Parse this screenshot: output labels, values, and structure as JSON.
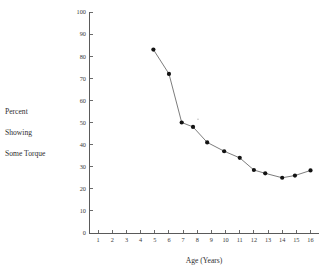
{
  "figure": {
    "background_color": "#ffffff",
    "axis_color": "#5a5a5a",
    "line_color": "#6d6d6d",
    "marker_color": "#131313"
  },
  "ylabel": {
    "line1": "Percent",
    "line2": "Showing",
    "line3": "Some Torque"
  },
  "xlabel": "Age (Years)",
  "chart_data": {
    "type": "line",
    "title": "",
    "subtitle": "",
    "xlabel": "Age (Years)",
    "ylabel": "Percent Showing Some Torque",
    "xlim": [
      0.35,
      16.6
    ],
    "ylim": [
      0,
      100
    ],
    "grid": false,
    "legend": "none",
    "xticks": [
      1,
      2,
      3,
      4,
      5,
      6,
      7,
      8,
      9,
      10,
      11,
      12,
      13,
      14,
      15,
      16
    ],
    "xtick_labels": [
      "1",
      "2",
      "3",
      "4",
      "5",
      "6",
      "7",
      "8",
      "9",
      "10",
      "11",
      "12",
      "13",
      "14",
      "15",
      "16"
    ],
    "yticks": [
      0,
      10,
      20,
      30,
      40,
      50,
      60,
      70,
      80,
      90,
      100
    ],
    "ytick_labels": [
      "0",
      "10",
      "20",
      "30",
      "40",
      "50",
      "60",
      "70",
      "80",
      "90",
      "100"
    ],
    "x": [
      4.9,
      6.0,
      6.9,
      7.7,
      8.7,
      9.9,
      11.0,
      12.0,
      12.8,
      14.0,
      14.9,
      16.0
    ],
    "y": [
      83,
      72,
      50,
      48,
      41,
      37,
      34,
      28.5,
      27,
      25,
      26,
      28.3
    ],
    "series": [
      {
        "name": "Percent Showing Some Torque",
        "x": [
          4.9,
          6.0,
          6.9,
          7.7,
          8.7,
          9.9,
          11.0,
          12.0,
          12.8,
          14.0,
          14.9,
          16.0
        ],
        "values": [
          83,
          72,
          50,
          48,
          41,
          37,
          34,
          28.5,
          27,
          25,
          26,
          28.3
        ]
      }
    ],
    "annotations": [
      {
        "name": "print-speck",
        "x": 8.05,
        "y": 51.5
      }
    ]
  }
}
